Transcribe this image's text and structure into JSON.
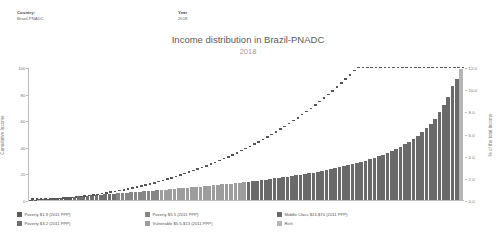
{
  "filters": {
    "country": {
      "label": "Country:",
      "value": "Brazil-PNADC"
    },
    "year": {
      "label": "Year",
      "value": "2018"
    }
  },
  "header": {
    "title": "Income distribution in Brazil-PNADC",
    "subtitle": "2018"
  },
  "legend": {
    "items": [
      {
        "label": "Poverty $1.9 (2011 PPP)",
        "color": "#5b5b5b"
      },
      {
        "label": "Poverty $3.2 (2011 PPP)",
        "color": "#6f6f6f"
      },
      {
        "label": "Poverty $5.5 (2011 PPP)",
        "color": "#868686"
      },
      {
        "label": "Vulnerable $5.5-$13 (2011 PPP)",
        "color": "#9d9d9d"
      },
      {
        "label": "Middle Class $13-$70 (2011 PPP)",
        "color": "#6a6a6a"
      },
      {
        "label": "Rich",
        "color": "#b5b5b5"
      }
    ]
  },
  "chart_data": {
    "type": "bar",
    "title": "Income distribution in Brazil-PNADC",
    "subtitle": "2018",
    "xlabel": "",
    "ylabel": "Cumulative Income",
    "y2label": "% of the total income",
    "ylim": [
      0,
      100
    ],
    "y2lim": [
      0,
      12
    ],
    "yticks": [
      0,
      20,
      40,
      60,
      80,
      100
    ],
    "y2ticks": [
      "0.0",
      "2.0",
      "4.0",
      "6.0",
      "8.0",
      "10.0",
      "12.0"
    ],
    "grid": false,
    "legend_position": "bottom",
    "categories": [
      "1",
      "2",
      "3",
      "4",
      "5",
      "6",
      "7",
      "8",
      "9",
      "10",
      "11",
      "12",
      "13",
      "14",
      "15",
      "16",
      "17",
      "18",
      "19",
      "20",
      "21",
      "22",
      "23",
      "24",
      "25",
      "26",
      "27",
      "28",
      "29",
      "30",
      "31",
      "32",
      "33",
      "34",
      "35",
      "36",
      "37",
      "38",
      "39",
      "40",
      "41",
      "42",
      "43",
      "44",
      "45",
      "46",
      "47",
      "48",
      "49",
      "50",
      "51",
      "52",
      "53",
      "54",
      "55",
      "56",
      "57",
      "58",
      "59",
      "60",
      "61",
      "62",
      "63",
      "64",
      "65",
      "66",
      "67",
      "68",
      "69",
      "70",
      "71",
      "72",
      "73",
      "74",
      "75",
      "76",
      "77",
      "78",
      "79",
      "80",
      "81",
      "82",
      "83",
      "84",
      "85",
      "86",
      "87",
      "88",
      "89",
      "90",
      "91",
      "92",
      "93",
      "94",
      "95",
      "96",
      "97",
      "98",
      "99",
      "100"
    ],
    "series": [
      {
        "name": "% of the total income",
        "type": "bar",
        "axis": "right",
        "values": [
          0.02,
          0.04,
          0.07,
          0.1,
          0.13,
          0.16,
          0.19,
          0.22,
          0.25,
          0.28,
          0.31,
          0.34,
          0.37,
          0.4,
          0.43,
          0.46,
          0.49,
          0.52,
          0.55,
          0.58,
          0.61,
          0.64,
          0.67,
          0.7,
          0.73,
          0.76,
          0.79,
          0.82,
          0.85,
          0.88,
          0.92,
          0.95,
          0.98,
          1.01,
          1.05,
          1.08,
          1.12,
          1.15,
          1.19,
          1.22,
          1.26,
          1.3,
          1.34,
          1.38,
          1.42,
          1.46,
          1.5,
          1.54,
          1.58,
          1.62,
          1.67,
          1.71,
          1.76,
          1.81,
          1.86,
          1.91,
          1.96,
          2.01,
          2.07,
          2.12,
          2.18,
          2.24,
          2.3,
          2.36,
          2.43,
          2.5,
          2.57,
          2.64,
          2.72,
          2.8,
          2.88,
          2.97,
          3.06,
          3.16,
          3.26,
          3.36,
          3.47,
          3.59,
          3.71,
          3.84,
          3.98,
          4.13,
          4.29,
          4.46,
          4.64,
          4.84,
          5.06,
          5.3,
          5.56,
          5.85,
          6.17,
          6.53,
          6.94,
          7.41,
          7.96,
          8.61,
          9.4,
          10.4,
          11.0,
          11.9
        ],
        "colors": [
          "#5b5b5b",
          "#5b5b5b",
          "#5b5b5b",
          "#5b5b5b",
          "#5b5b5b",
          "#5b5b5b",
          "#5b5b5b",
          "#5b5b5b",
          "#5b5b5b",
          "#5b5b5b",
          "#6f6f6f",
          "#6f6f6f",
          "#6f6f6f",
          "#6f6f6f",
          "#6f6f6f",
          "#6f6f6f",
          "#6f6f6f",
          "#6f6f6f",
          "#6f6f6f",
          "#6f6f6f",
          "#868686",
          "#868686",
          "#868686",
          "#868686",
          "#868686",
          "#868686",
          "#868686",
          "#868686",
          "#868686",
          "#868686",
          "#9d9d9d",
          "#9d9d9d",
          "#9d9d9d",
          "#9d9d9d",
          "#9d9d9d",
          "#9d9d9d",
          "#9d9d9d",
          "#9d9d9d",
          "#9d9d9d",
          "#9d9d9d",
          "#9d9d9d",
          "#9d9d9d",
          "#9d9d9d",
          "#9d9d9d",
          "#9d9d9d",
          "#9d9d9d",
          "#9d9d9d",
          "#9d9d9d",
          "#9d9d9d",
          "#9d9d9d",
          "#6a6a6a",
          "#6a6a6a",
          "#6a6a6a",
          "#6a6a6a",
          "#6a6a6a",
          "#6a6a6a",
          "#6a6a6a",
          "#6a6a6a",
          "#6a6a6a",
          "#6a6a6a",
          "#6a6a6a",
          "#6a6a6a",
          "#6a6a6a",
          "#6a6a6a",
          "#6a6a6a",
          "#6a6a6a",
          "#6a6a6a",
          "#6a6a6a",
          "#6a6a6a",
          "#6a6a6a",
          "#6a6a6a",
          "#6a6a6a",
          "#6a6a6a",
          "#6a6a6a",
          "#6a6a6a",
          "#6a6a6a",
          "#6a6a6a",
          "#6a6a6a",
          "#6a6a6a",
          "#6a6a6a",
          "#6a6a6a",
          "#6a6a6a",
          "#6a6a6a",
          "#6a6a6a",
          "#6a6a6a",
          "#6a6a6a",
          "#6a6a6a",
          "#6a6a6a",
          "#6a6a6a",
          "#6a6a6a",
          "#6a6a6a",
          "#6a6a6a",
          "#6a6a6a",
          "#6a6a6a",
          "#6a6a6a",
          "#6a6a6a",
          "#6a6a6a",
          "#6a6a6a",
          "#6a6a6a",
          "#b5b5b5"
        ]
      },
      {
        "name": "Cumulative Income",
        "type": "scatter",
        "axis": "left",
        "color": "#555555",
        "values": [
          0.02,
          0.06,
          0.13,
          0.23,
          0.36,
          0.52,
          0.71,
          0.93,
          1.18,
          1.46,
          1.77,
          2.11,
          2.48,
          2.88,
          3.31,
          3.77,
          4.26,
          4.78,
          5.33,
          5.91,
          6.52,
          7.16,
          7.83,
          8.53,
          9.26,
          10.02,
          10.81,
          11.63,
          12.48,
          13.36,
          14.28,
          15.23,
          16.21,
          17.22,
          18.27,
          19.35,
          20.47,
          21.62,
          22.81,
          24.03,
          25.29,
          26.59,
          27.93,
          29.31,
          30.73,
          32.19,
          33.69,
          35.23,
          36.81,
          38.43,
          40.1,
          41.81,
          43.57,
          45.38,
          47.24,
          49.15,
          51.11,
          53.12,
          55.19,
          57.31,
          59.49,
          61.73,
          64.03,
          66.39,
          68.82,
          71.32,
          73.89,
          76.53,
          79.25,
          82.05,
          84.93,
          87.9,
          90.96,
          94.12,
          97.38,
          100.0,
          100.0,
          100.0,
          100.0,
          100.0,
          100.0,
          100.0,
          100.0,
          100.0,
          100.0,
          100.0,
          100.0,
          100.0,
          100.0,
          100.0,
          100.0,
          100.0,
          100.0,
          100.0,
          100.0,
          100.0,
          100.0,
          100.0,
          100.0,
          100.0
        ]
      }
    ]
  }
}
